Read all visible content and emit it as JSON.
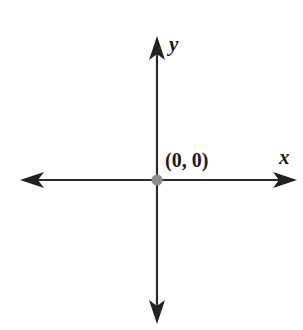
{
  "diagram": {
    "type": "coordinate-axes",
    "x_axis": {
      "label": "x",
      "direction": "bidirectional",
      "arrows": [
        "left",
        "right"
      ]
    },
    "y_axis": {
      "label": "y",
      "direction": "bidirectional",
      "arrows": [
        "up",
        "down"
      ]
    },
    "origin": {
      "label": "(0, 0)",
      "marker": "point"
    },
    "colors": {
      "axis": "#2b2b2b",
      "origin_point": "#8c8c8c",
      "text": "#1a1a1a",
      "background": "#ffffff"
    }
  }
}
